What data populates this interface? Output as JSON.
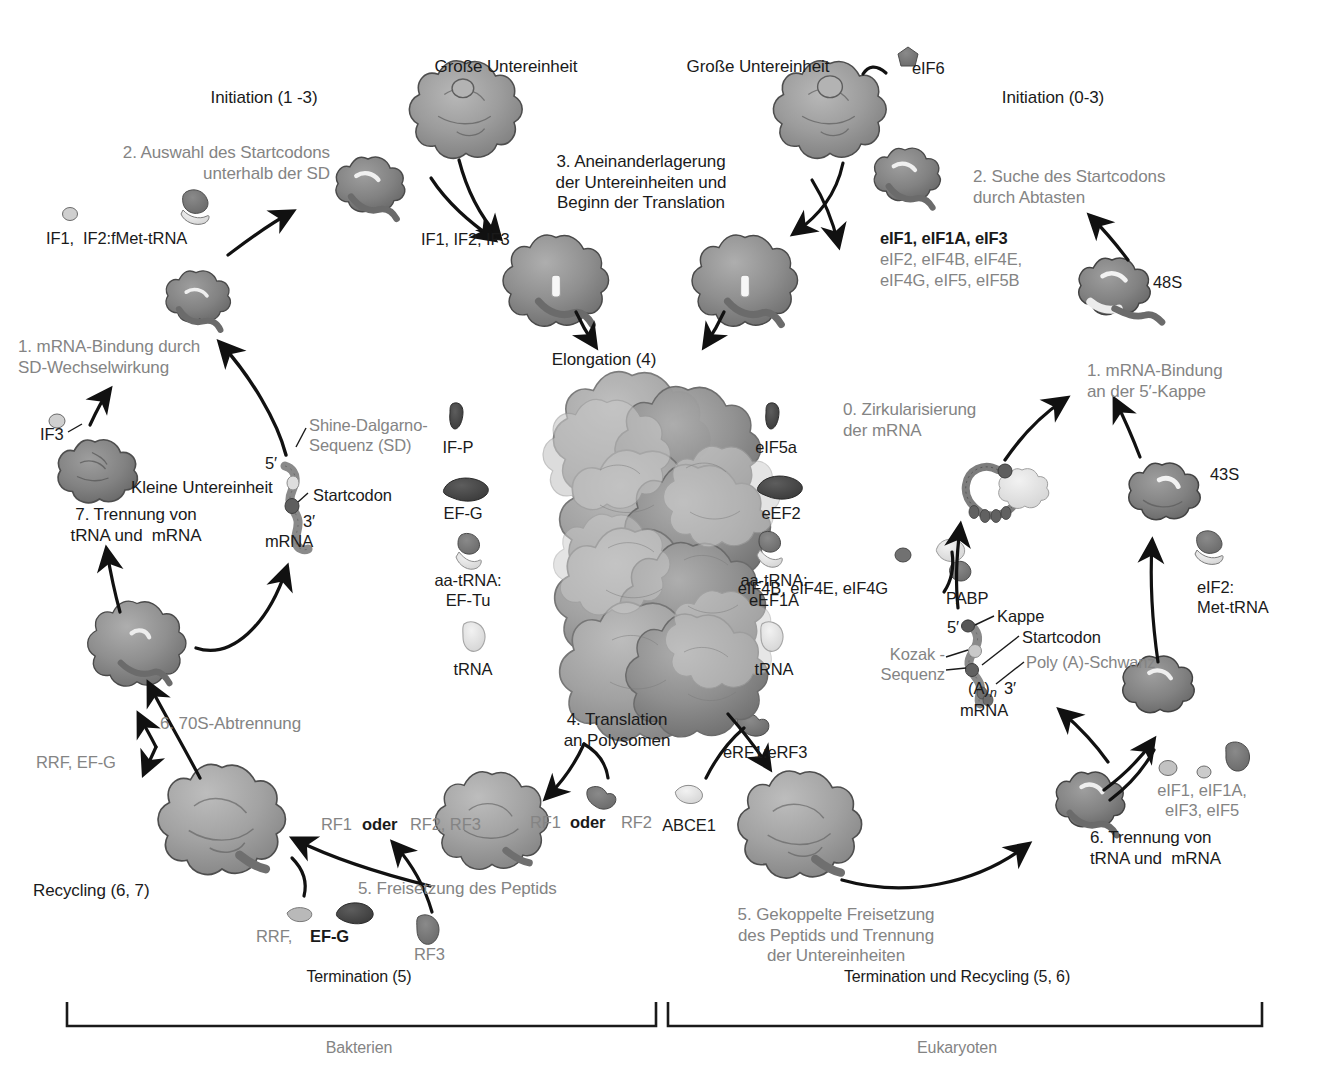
{
  "figure": {
    "title_bacteria_phase_initiation": "Initiation (1 -3)",
    "title_eukaryote_phase_initiation": "Initiation (0-3)",
    "elongation_label": "Elongation (4)"
  },
  "bacteria": {
    "step1": "1. mRNA-Bindung durch\nSD-Wechselwirkung",
    "step2": "2. Auswahl des Startcodons\nunterhalb der SD",
    "step3": "3. Aneinanderlagerung\nder Untereinheiten und\nBeginn der Translation",
    "step4": "4. Translation\nan Polysomen",
    "step5": "5. Freisetzung des Peptids",
    "step6": "6. 70S-Abtrennung",
    "step7": "7. Trennung von\ntRNA und  mRNA",
    "large_subunit": "Große Untereinheit",
    "small_subunit": "Kleine Untereinheit",
    "factors_if": "IF1,  IF2:fMet-tRNA",
    "factor_if3": "IF3",
    "factors_if123": "IF1, IF2, IF3",
    "recycling": "Recycling (6, 7)",
    "rrf_efg_top": "RRF, EF-G",
    "rrf_efg_bottom_a": "RRF,",
    "rrf_efg_bottom_b": "EF-G",
    "rf_choice_left_a": "RF1",
    "rf_choice_left_oder": "oder",
    "rf_choice_left_b": "RF2, RF3",
    "rf_choice_mid_a": "RF1",
    "rf_choice_mid_oder": "oder",
    "rf_choice_mid_b": "RF2",
    "rf3": "RF3",
    "mrna_label": "mRNA",
    "five_prime": "5′",
    "three_prime": "3′",
    "shine_dalgarno": "Shine-Dalgarno-\nSequenz (SD)",
    "startcodon": "Startcodon"
  },
  "eukaryote": {
    "step0": "0. Zirkularisierung\nder mRNA",
    "step1": "1. mRNA-Bindung\nan der 5′-Kappe",
    "step2": "2. Suche des Startcodons\ndurch Abtasten",
    "step5": "5. Gekoppelte Freisetzung\ndes Peptids und Trennung\nder Untereinheiten",
    "step6": "6. Trennung von\ntRNA und  mRNA",
    "large_subunit": "Große Untereinheit",
    "eif6": "eIF6",
    "init_factors_line1": "eIF1, eIF1A, eIF3",
    "init_factors_line2": "eIF2, eIF4B, eIF4E,",
    "init_factors_line3": "eIF4G, eIF5, eIF5B",
    "complex_48s": "48S",
    "complex_43s": "43S",
    "eif4_group": "eIF4B, eIF4E, eIF4G",
    "pabp": "PABP",
    "eif2_met_trna": "eIF2:\nMet-tRNA",
    "erf1_erf3": "eRF1:eRF3",
    "abce1": "ABCE1",
    "recycle_factors": "eIF1, eIF1A,\neIF3, eIF5",
    "mrna_label": "mRNA",
    "five_prime": "5′",
    "three_prime": "3′",
    "kappe": "Kappe",
    "startcodon": "Startcodon",
    "kozak": "Kozak -\nSequenz",
    "poly_a": "Poly (A)-Schwanz",
    "poly_a_n": "(A)"
  },
  "elongation": {
    "bacteria_factors": [
      "IF-P",
      "EF-G",
      "aa-tRNA:\nEF-Tu",
      "tRNA"
    ],
    "eukaryote_factors": [
      "eIF5a",
      "eEF2",
      "aa-tRNA:\neEF1A",
      "tRNA"
    ]
  },
  "brackets": {
    "left_top": "Termination (5)",
    "left_bottom": "Bakterien",
    "right_top": "Termination und Recycling (5, 6)",
    "right_bottom": "Eukaryoten"
  },
  "colors": {
    "gray_text": "#848484",
    "dark_text": "#1a1a1a",
    "ribosome_large": "#9a9a9a",
    "ribosome_small": "#7d7d7d",
    "trna_light": "#e3e3e3",
    "factor_dark": "#4a4a4a",
    "arrow": "#111111"
  }
}
